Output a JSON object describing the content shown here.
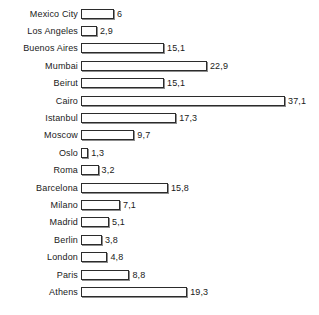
{
  "chart_data": {
    "type": "bar",
    "orientation": "horizontal",
    "title": "",
    "subtitle": "",
    "xlabel": "",
    "ylabel": "",
    "grid": false,
    "legend": null,
    "decimal_separator": ",",
    "xlim": [
      0,
      37.1
    ],
    "categories": [
      "Mexico City",
      "Los Angeles",
      "Buenos Aires",
      "Mumbai",
      "Beirut",
      "Cairo",
      "Istanbul",
      "Moscow",
      "Oslo",
      "Roma",
      "Barcelona",
      "Milano",
      "Madrid",
      "Berlin",
      "London",
      "Paris",
      "Athens"
    ],
    "values": [
      6,
      2.9,
      15.1,
      22.9,
      15.1,
      37.1,
      17.3,
      9.7,
      1.3,
      3.2,
      15.8,
      7.1,
      5.1,
      3.8,
      4.8,
      8.8,
      19.3
    ],
    "value_labels": [
      "6",
      "2,9",
      "15,1",
      "22,9",
      "15,1",
      "37,1",
      "17,3",
      "9,7",
      "1,3",
      "3,2",
      "15,8",
      "7,1",
      "5,1",
      "3,8",
      "4,8",
      "8,8",
      "19,3"
    ],
    "colors": {
      "bar_fill": "#fefefe",
      "bar_outline": "#2b2b2b",
      "bar_shadow": "#8d8d8d",
      "text": "#1a1a1a",
      "background": "#ffffff"
    }
  },
  "rows": [
    {
      "label": "Mexico City",
      "value": 6,
      "value_label": "6"
    },
    {
      "label": "Los Angeles",
      "value": 2.9,
      "value_label": "2,9"
    },
    {
      "label": "Buenos Aires",
      "value": 15.1,
      "value_label": "15,1"
    },
    {
      "label": "Mumbai",
      "value": 22.9,
      "value_label": "22,9"
    },
    {
      "label": "Beirut",
      "value": 15.1,
      "value_label": "15,1"
    },
    {
      "label": "Cairo",
      "value": 37.1,
      "value_label": "37,1"
    },
    {
      "label": "Istanbul",
      "value": 17.3,
      "value_label": "17,3"
    },
    {
      "label": "Moscow",
      "value": 9.7,
      "value_label": "9,7"
    },
    {
      "label": "Oslo",
      "value": 1.3,
      "value_label": "1,3"
    },
    {
      "label": "Roma",
      "value": 3.2,
      "value_label": "3,2"
    },
    {
      "label": "Barcelona",
      "value": 15.8,
      "value_label": "15,8"
    },
    {
      "label": "Milano",
      "value": 7.1,
      "value_label": "7,1"
    },
    {
      "label": "Madrid",
      "value": 5.1,
      "value_label": "5,1"
    },
    {
      "label": "Berlin",
      "value": 3.8,
      "value_label": "3,8"
    },
    {
      "label": "London",
      "value": 4.8,
      "value_label": "4,8"
    },
    {
      "label": "Paris",
      "value": 8.8,
      "value_label": "8,8"
    },
    {
      "label": "Athens",
      "value": 19.3,
      "value_label": "19,3"
    }
  ],
  "scale": {
    "px_per_unit": 5.5,
    "max_value": 37.1
  }
}
